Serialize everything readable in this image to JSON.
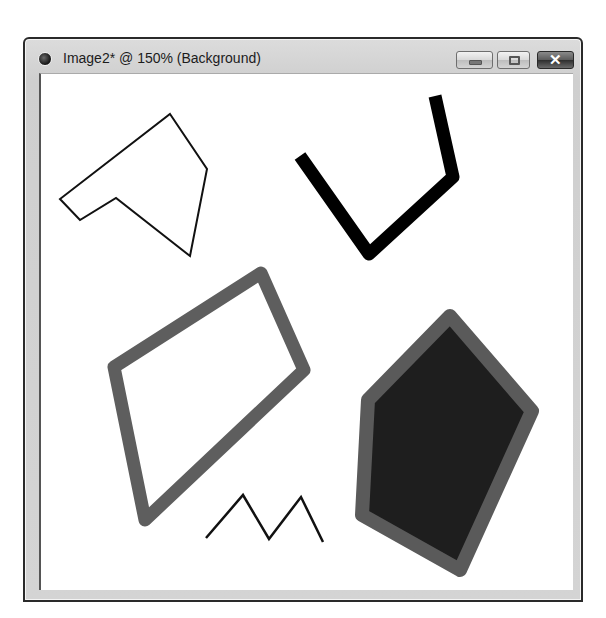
{
  "window": {
    "title": "Image2* @ 150% (Background)",
    "icon": "app-document-icon",
    "controls": {
      "minimize": {
        "icon": "minimize-icon",
        "glyph": ""
      },
      "maximize": {
        "icon": "maximize-icon",
        "glyph": ""
      },
      "close": {
        "icon": "close-icon",
        "glyph": "✕"
      }
    }
  },
  "canvas": {
    "zoom": "150%",
    "layer": "Background",
    "background_color": "#ffffff",
    "shapes": [
      {
        "name": "thin-outline-polygon",
        "type": "polygon",
        "stroke": "#111111",
        "stroke_width": 2,
        "fill": "none",
        "points": "170,114 207,169 190,256 116,198 80,220 60,199"
      },
      {
        "name": "thick-black-polyline",
        "type": "polyline",
        "stroke": "#000000",
        "stroke_width": 13,
        "fill": "none",
        "points": "300,156 369,254 453,177 435,96"
      },
      {
        "name": "gray-thick-quadrilateral",
        "type": "polygon",
        "stroke": "#5e5e5e",
        "stroke_width": 13,
        "fill": "none",
        "points": "114,367 261,273 304,370 145,520"
      },
      {
        "name": "zigzag-polyline",
        "type": "polyline",
        "stroke": "#111111",
        "stroke_width": 2.5,
        "fill": "none",
        "points": "206,538 243,495 269,539 301,497 323,542"
      },
      {
        "name": "filled-dark-pentagon",
        "type": "polygon",
        "stroke": "#5a5a5a",
        "stroke_width": 14,
        "fill": "#1e1e1e",
        "points": "450,316 532,411 460,570 362,515 368,400"
      }
    ]
  }
}
